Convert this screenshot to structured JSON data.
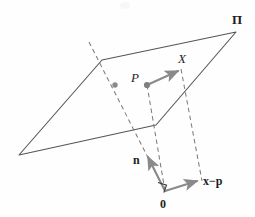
{
  "figure": {
    "title_label": "",
    "type": "geometry-diagram",
    "colors": {
      "line": "#555555",
      "dashed": "#7d7d7d",
      "vector": "#8a8a8a",
      "dot": "#8a8a8a",
      "text": "#1d1d1d",
      "background": "#fefefe"
    }
  },
  "labels": {
    "plane": "Π",
    "point_X": "X",
    "point_P": "P",
    "normal_vector": "n",
    "difference_vector": "x−p",
    "origin": "0"
  },
  "geometry": {
    "plane_vertices": [
      [
        102,
        60
      ],
      [
        236,
        32
      ],
      [
        156,
        125
      ],
      [
        19,
        155
      ]
    ],
    "origin_point": [
      165,
      191
    ],
    "point_P": [
      147,
      85
    ],
    "point_X_tip": [
      181,
      70
    ],
    "normal_tip": [
      146,
      154
    ],
    "difference_tip": [
      200,
      180
    ],
    "plane_dot": [
      115,
      85
    ],
    "right_angle_marker": [
      165,
      191
    ],
    "dashed_lines": [
      {
        "name": "dash-upper-left-to-origin",
        "from": [
          89,
          42
        ],
        "to": [
          165,
          191
        ]
      },
      {
        "name": "dash-P-to-origin",
        "from": [
          147,
          85
        ],
        "to": [
          165,
          191
        ]
      },
      {
        "name": "dash-X-to-xminusp",
        "from": [
          181,
          69
        ],
        "to": [
          202,
          181
        ]
      }
    ]
  }
}
